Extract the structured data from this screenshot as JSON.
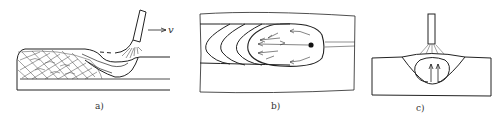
{
  "figure": {
    "panels": [
      {
        "id": "a",
        "caption": "a)",
        "description": "Side view of moving weld pool with electrode, arc, solidified ripples and molten pool flow",
        "velocity_label": "v"
      },
      {
        "id": "b",
        "caption": "b)",
        "description": "Top view of weld pool with successive solidification front contours and internal flow arrows"
      },
      {
        "id": "c",
        "caption": "c)",
        "description": "Cross-section view of weld pool under stationary electrode with upward convection arrows"
      }
    ],
    "colors": {
      "line": "#222222",
      "background": "#ffffff"
    }
  }
}
